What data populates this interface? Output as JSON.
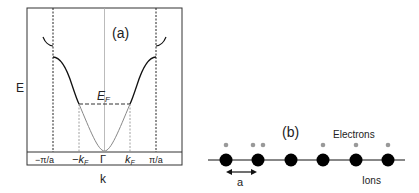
{
  "panel_a": {
    "label": "(a)",
    "y_axis_label": "E",
    "x_axis_label": "k",
    "fermi_label": "E",
    "fermi_subscript": "F",
    "ticks": [
      {
        "main": "−π/a",
        "sub": ""
      },
      {
        "main": "−k",
        "sub": "F"
      },
      {
        "main": "Γ",
        "sub": ""
      },
      {
        "main": "k",
        "sub": "F"
      },
      {
        "main": "π/a",
        "sub": ""
      }
    ],
    "colors": {
      "curve_outer": "#111111",
      "curve_inner": "#888888",
      "frame": "#333333",
      "dashed": "#222222"
    }
  },
  "panel_b": {
    "label": "(b)",
    "electrons_label": "Electrons",
    "ions_label": "Ions",
    "spacing_label": "a",
    "ion_count": 6,
    "colors": {
      "ion": "#000000",
      "electron": "#999999"
    }
  }
}
